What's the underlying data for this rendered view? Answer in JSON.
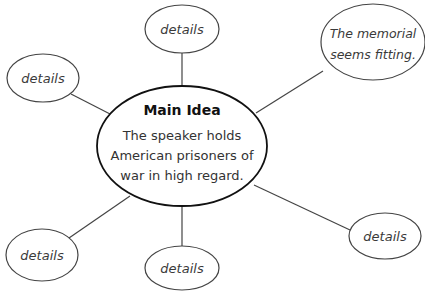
{
  "diagram": {
    "type": "web-organizer",
    "main": {
      "title": "Main Idea",
      "lines": [
        "The speaker holds",
        "American prisoners of",
        "war in high regard."
      ]
    },
    "nodes": [
      {
        "id": "top",
        "lines": [
          "details"
        ]
      },
      {
        "id": "top-right",
        "lines": [
          "The memorial",
          "seems fitting."
        ]
      },
      {
        "id": "left",
        "lines": [
          "details"
        ]
      },
      {
        "id": "bottom-left",
        "lines": [
          "details"
        ]
      },
      {
        "id": "bottom-middle",
        "lines": [
          "details"
        ]
      },
      {
        "id": "bottom-right",
        "lines": [
          "details"
        ]
      }
    ],
    "colors": {
      "stroke": "#333333",
      "main_stroke": "#111111",
      "text": "#3a3a3a",
      "background": "#ffffff"
    }
  }
}
